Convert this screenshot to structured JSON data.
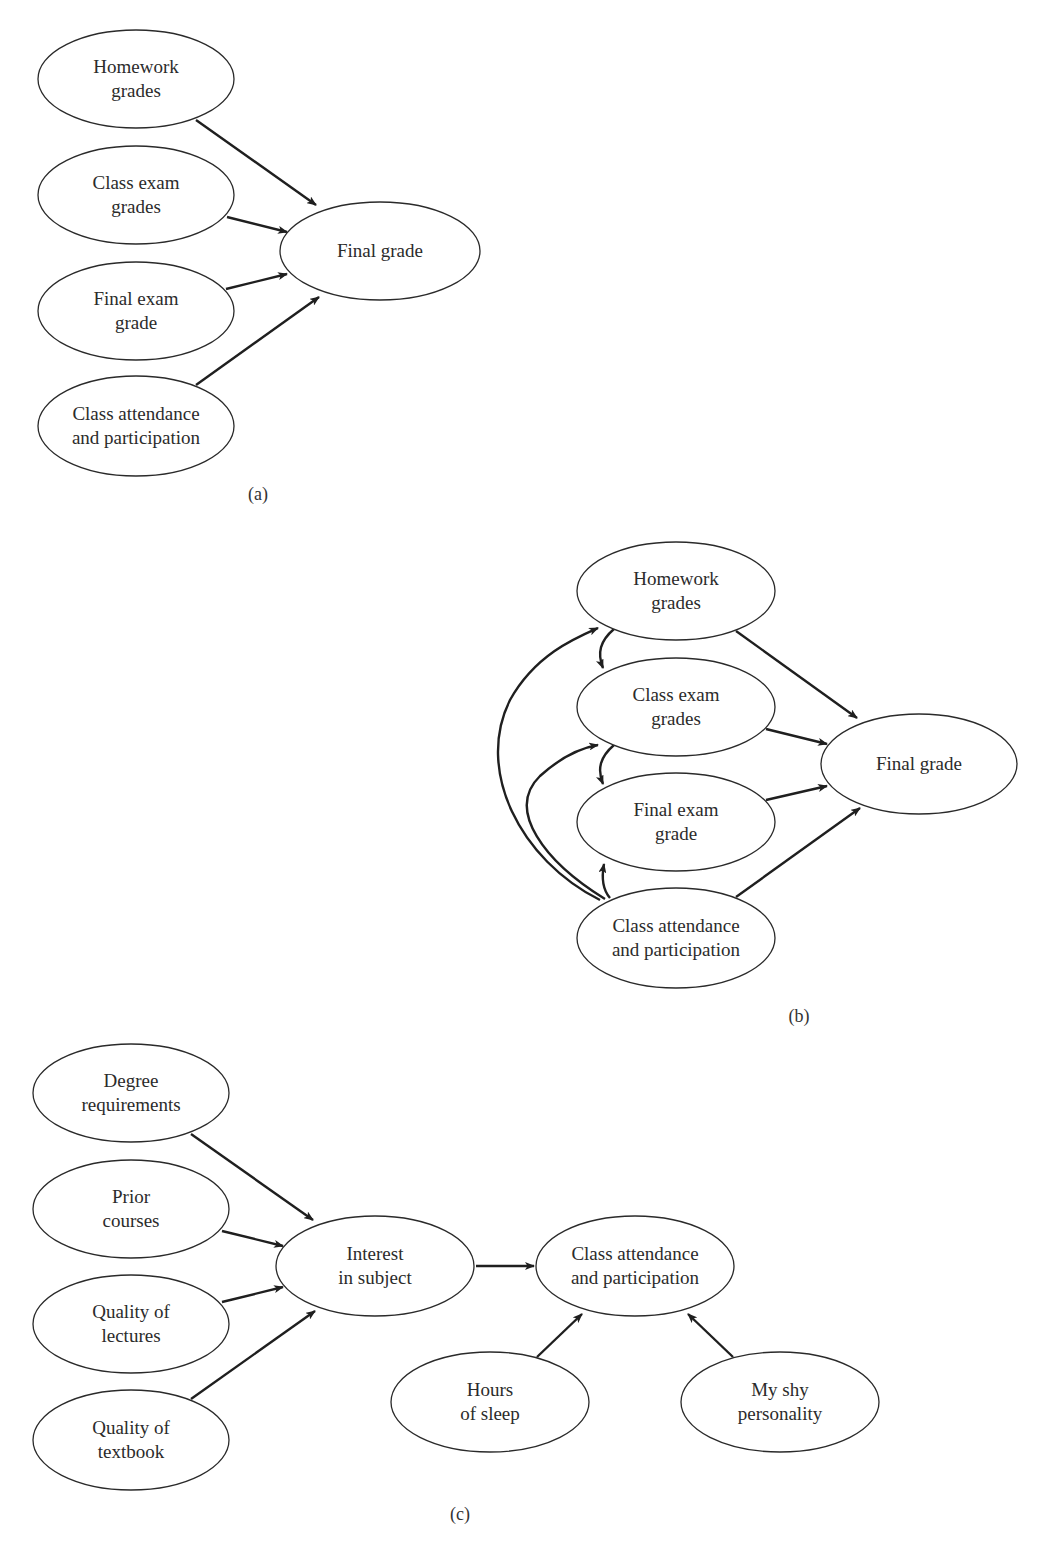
{
  "colors": {
    "background": "#ffffff",
    "stroke": "#2a2a2a",
    "arrow": "#1f1f1f",
    "text": "#2b2b2b"
  },
  "panels": [
    {
      "id": "a",
      "caption": "(a)",
      "caption_pos": [
        258,
        500
      ],
      "nodes": [
        {
          "id": "homework",
          "lines": [
            "Homework",
            "grades"
          ],
          "cx": 136,
          "cy": 79,
          "rx": 98,
          "ry": 49
        },
        {
          "id": "class_exam",
          "lines": [
            "Class exam",
            "grades"
          ],
          "cx": 136,
          "cy": 195,
          "rx": 98,
          "ry": 49
        },
        {
          "id": "final_exam",
          "lines": [
            "Final exam",
            "grade"
          ],
          "cx": 136,
          "cy": 311,
          "rx": 98,
          "ry": 49
        },
        {
          "id": "attendance",
          "lines": [
            "Class attendance",
            "and participation"
          ],
          "cx": 136,
          "cy": 426,
          "rx": 98,
          "ry": 50
        },
        {
          "id": "final_grade",
          "lines": [
            "Final grade"
          ],
          "cx": 380,
          "cy": 251,
          "rx": 100,
          "ry": 49
        }
      ],
      "edges": [
        {
          "from": "homework",
          "to": "final_grade",
          "d": "M196,120 L316,205"
        },
        {
          "from": "class_exam",
          "to": "final_grade",
          "d": "M227,217 L287,232"
        },
        {
          "from": "final_exam",
          "to": "final_grade",
          "d": "M226,289 L287,274"
        },
        {
          "from": "attendance",
          "to": "final_grade",
          "d": "M196,385 L319,297"
        }
      ]
    },
    {
      "id": "b",
      "caption": "(b)",
      "caption_pos": [
        799,
        1022
      ],
      "nodes": [
        {
          "id": "homework",
          "lines": [
            "Homework",
            "grades"
          ],
          "cx": 676,
          "cy": 591,
          "rx": 99,
          "ry": 49
        },
        {
          "id": "class_exam",
          "lines": [
            "Class exam",
            "grades"
          ],
          "cx": 676,
          "cy": 707,
          "rx": 99,
          "ry": 49
        },
        {
          "id": "final_exam",
          "lines": [
            "Final exam",
            "grade"
          ],
          "cx": 676,
          "cy": 822,
          "rx": 99,
          "ry": 49
        },
        {
          "id": "attendance",
          "lines": [
            "Class attendance",
            "and participation"
          ],
          "cx": 676,
          "cy": 938,
          "rx": 99,
          "ry": 50
        },
        {
          "id": "final_grade",
          "lines": [
            "Final grade"
          ],
          "cx": 919,
          "cy": 764,
          "rx": 98,
          "ry": 50
        }
      ],
      "edges": [
        {
          "from": "homework",
          "to": "final_grade",
          "d": "M736,631 L857,718"
        },
        {
          "from": "class_exam",
          "to": "final_grade",
          "d": "M766,729 L827,744"
        },
        {
          "from": "final_exam",
          "to": "final_grade",
          "d": "M766,800 L827,786"
        },
        {
          "from": "attendance",
          "to": "final_grade",
          "d": "M736,897 L860,808"
        },
        {
          "from": "homework",
          "to": "class_exam",
          "d": "M614,629 C600,641 597,653 603,668"
        },
        {
          "from": "class_exam",
          "to": "final_exam",
          "d": "M614,745 C600,757 597,769 603,784"
        },
        {
          "from": "attendance",
          "to": "final_exam",
          "d": "M610,898 C603,890 601,880 604,864"
        },
        {
          "from": "attendance",
          "to": "class_exam",
          "d": "M605,899 C545,862 505,810 540,776 C560,758 580,748 598,745"
        },
        {
          "from": "attendance",
          "to": "homework",
          "d": "M600,900 C520,860 475,770 510,700 C535,655 575,638 598,628"
        }
      ]
    },
    {
      "id": "c",
      "caption": "(c)",
      "caption_pos": [
        460,
        1520
      ],
      "nodes": [
        {
          "id": "degree",
          "lines": [
            "Degree",
            "requirements"
          ],
          "cx": 131,
          "cy": 1093,
          "rx": 98,
          "ry": 49
        },
        {
          "id": "prior",
          "lines": [
            "Prior",
            "courses"
          ],
          "cx": 131,
          "cy": 1209,
          "rx": 98,
          "ry": 49
        },
        {
          "id": "lectures",
          "lines": [
            "Quality of",
            "lectures"
          ],
          "cx": 131,
          "cy": 1324,
          "rx": 98,
          "ry": 49
        },
        {
          "id": "textbook",
          "lines": [
            "Quality of",
            "textbook"
          ],
          "cx": 131,
          "cy": 1440,
          "rx": 98,
          "ry": 50
        },
        {
          "id": "interest",
          "lines": [
            "Interest",
            "in subject"
          ],
          "cx": 375,
          "cy": 1266,
          "rx": 99,
          "ry": 50
        },
        {
          "id": "attendance",
          "lines": [
            "Class attendance",
            "and participation"
          ],
          "cx": 635,
          "cy": 1266,
          "rx": 99,
          "ry": 50
        },
        {
          "id": "sleep",
          "lines": [
            "Hours",
            "of sleep"
          ],
          "cx": 490,
          "cy": 1402,
          "rx": 99,
          "ry": 50
        },
        {
          "id": "shy",
          "lines": [
            "My shy",
            "personality"
          ],
          "cx": 780,
          "cy": 1402,
          "rx": 99,
          "ry": 50
        }
      ],
      "edges": [
        {
          "from": "degree",
          "to": "interest",
          "d": "M191,1134 L313,1220"
        },
        {
          "from": "prior",
          "to": "interest",
          "d": "M222,1231 L283,1246"
        },
        {
          "from": "lectures",
          "to": "interest",
          "d": "M222,1302 L283,1287"
        },
        {
          "from": "textbook",
          "to": "interest",
          "d": "M191,1399 L315,1311"
        },
        {
          "from": "interest",
          "to": "attendance",
          "d": "M476,1266 L534,1266"
        },
        {
          "from": "sleep",
          "to": "attendance",
          "d": "M537,1357 L582,1314"
        },
        {
          "from": "shy",
          "to": "attendance",
          "d": "M733,1357 L688,1314"
        }
      ]
    }
  ]
}
